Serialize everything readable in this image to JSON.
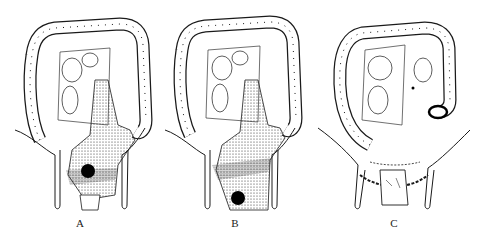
{
  "figure": {
    "panels": [
      {
        "id": "A",
        "label": "A",
        "description": "colon with rectal tumor (dark mass) within stippled pelvic region"
      },
      {
        "id": "B",
        "label": "B",
        "description": "colon with lower rectal tumor (dark mass) within stippled pelvic region"
      },
      {
        "id": "C",
        "label": "C",
        "description": "colon after resection with end colostomy stoma and sutured pelvic floor"
      }
    ],
    "colors": {
      "ink": "#1a1a1a",
      "background": "#ffffff",
      "tumor": "#000000"
    }
  }
}
